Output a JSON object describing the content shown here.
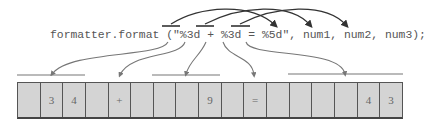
{
  "code": {
    "text": "formatter.format (\"%3d + %3d = %5d\", num1, num2, num3);",
    "specifiers": [
      "%3d",
      "%3d",
      "%5d"
    ],
    "arguments": [
      "num1",
      "num2",
      "num3"
    ]
  },
  "output_cells": [
    "",
    "3",
    "4",
    "",
    "+",
    "",
    "",
    "",
    "9",
    "",
    "=",
    "",
    "",
    "",
    "",
    "4",
    "3"
  ],
  "field_groups": [
    {
      "specifier": "%3d",
      "start_cell": 0,
      "width": 3,
      "value": "34"
    },
    {
      "specifier": "+",
      "start_cell": 3,
      "width": 3,
      "value": "+"
    },
    {
      "specifier": "%3d",
      "start_cell": 6,
      "width": 3,
      "value": "9"
    },
    {
      "specifier": "=",
      "start_cell": 9,
      "width": 3,
      "value": "="
    },
    {
      "specifier": "%5d",
      "start_cell": 12,
      "width": 5,
      "value": "43"
    }
  ],
  "colors": {
    "cell_fill": "#d4d4d4",
    "cell_border": "#555555",
    "arrow": "#444444",
    "text": "#555555"
  }
}
